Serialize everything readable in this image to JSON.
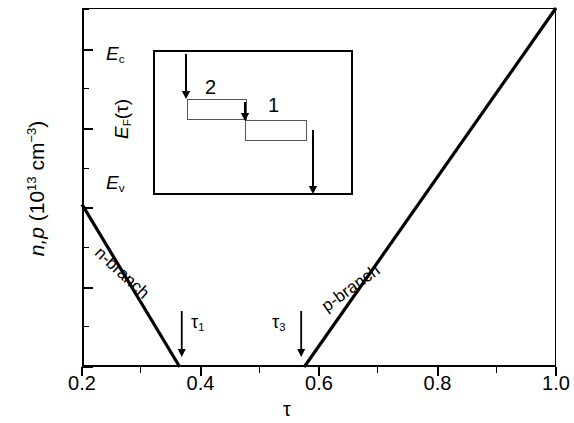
{
  "chart_data": {
    "type": "line",
    "title": "",
    "xlabel": "τ",
    "ylabel_parts": {
      "italic": "n,p",
      "unit_prefix": " (10",
      "exp": "13",
      "unit": " cm",
      "unit_exp": "−3",
      "close": ")"
    },
    "xlim": [
      0.2,
      1.0
    ],
    "ylim": [
      0,
      18.1
    ],
    "xticks": [
      "0.2",
      "0.4",
      "0.6",
      "0.8",
      "1.0"
    ],
    "xtick_values": [
      0.2,
      0.4,
      0.6,
      0.8,
      1.0
    ],
    "xminor_values": [
      0.3,
      0.5,
      0.7,
      0.9
    ],
    "yticks": [
      "0",
      "4",
      "8",
      "12",
      "16"
    ],
    "ytick_values": [
      0,
      4,
      8,
      12,
      16
    ],
    "yminor_values": [
      2,
      6,
      10,
      14,
      18
    ],
    "grid": false,
    "legend": "none",
    "series": [
      {
        "name": "n-branch",
        "label": "n-branch",
        "points": [
          [
            0.2,
            8.2
          ],
          [
            0.365,
            0.0
          ]
        ],
        "color": "#000000",
        "width": 3.2
      },
      {
        "name": "p-branch",
        "label": "p-branch",
        "points": [
          [
            0.575,
            0.0
          ],
          [
            1.0,
            18.1
          ]
        ],
        "color": "#000000",
        "width": 3.2
      }
    ],
    "annotations": [
      {
        "name": "tau1",
        "text": "τ1",
        "x": 0.365,
        "arrow": "down"
      },
      {
        "name": "tau3",
        "text": "τ3",
        "x": 0.575,
        "arrow": "down"
      }
    ]
  },
  "axes": {
    "y_title_italic": "n,p",
    "y_title_open": " (10",
    "y_title_exp1": "13",
    "y_title_mid": " cm",
    "y_title_exp2": "−3",
    "y_title_close": ")",
    "x_title": "τ"
  },
  "branches": {
    "n_label": "n-branch",
    "p_label": "p-branch"
  },
  "tau_markers": {
    "tau1_base": "τ",
    "tau1_sub": "1",
    "tau3_base": "τ",
    "tau3_sub": "3"
  },
  "inset": {
    "label_ec_base": "E",
    "label_ec_sub": "c",
    "label_ev_base": "E",
    "label_ev_sub": "v",
    "label_ef_base": "E",
    "label_ef_sub": "F",
    "label_ef_arg": "(τ)",
    "step_2": "2",
    "step_1": "1",
    "band_color": "#555555",
    "bands": [
      {
        "name": "band-upper",
        "left": 32,
        "top": 47,
        "width": 60,
        "height": 21
      },
      {
        "name": "band-lower",
        "left": 90,
        "top": 68,
        "width": 62,
        "height": 21
      }
    ],
    "arrows": [
      {
        "name": "arrow-ec-to-band",
        "x": 31,
        "y1": 2,
        "y2": 47
      },
      {
        "name": "arrow-band-to-band",
        "x": 90,
        "y1": 50,
        "y2": 69
      },
      {
        "name": "arrow-band-to-ev",
        "x": 158,
        "y1": 78,
        "y2": 142
      }
    ]
  },
  "colors": {
    "line": "#000000",
    "axis": "#000000",
    "inset_band": "#555555",
    "background": "#ffffff"
  }
}
